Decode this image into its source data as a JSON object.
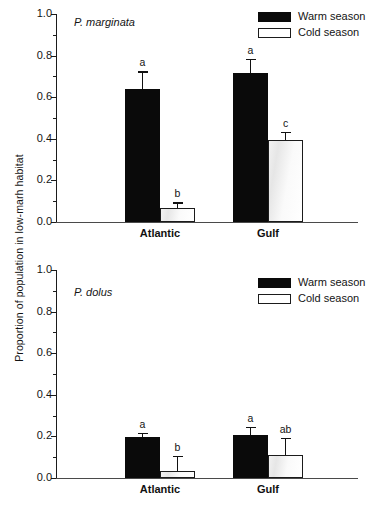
{
  "figure": {
    "ylabel": "Proportion of population in low-marh habitat"
  },
  "legend": {
    "warm_label": "Warm season",
    "cold_label": "Cold season"
  },
  "panels": [
    {
      "species": "P. marginata",
      "xticks": [
        "Atlantic",
        "Gulf"
      ],
      "yticks": [
        "1.0",
        "0.8",
        "0.6",
        "0.4",
        "0.2",
        "0.0"
      ]
    },
    {
      "species": "P. dolus",
      "xticks": [
        "Atlantic",
        "Gulf"
      ],
      "yticks": [
        "1.0",
        "0.8",
        "0.6",
        "0.4",
        "0.2",
        "0.0"
      ]
    }
  ],
  "chart_data": [
    {
      "type": "bar",
      "title": "P. marginata",
      "xlabel": "",
      "ylabel": "Proportion of population in low-marh habitat",
      "ylim": [
        0.0,
        1.0
      ],
      "ytick_values": [
        0.0,
        0.2,
        0.4,
        0.6,
        0.8,
        1.0
      ],
      "yminor_step": 0.1,
      "grid": false,
      "legend_position": "top-right",
      "categories": [
        "Atlantic",
        "Gulf"
      ],
      "series": [
        {
          "name": "Warm season",
          "color": "#0a0a0a",
          "values": [
            0.64,
            0.715
          ],
          "errors": [
            0.085,
            0.07
          ],
          "sig_letters": [
            "a",
            "a"
          ]
        },
        {
          "name": "Cold season",
          "color": "#ffffff",
          "values": [
            0.065,
            0.395
          ],
          "errors": [
            0.03,
            0.04
          ],
          "sig_letters": [
            "b",
            "c"
          ]
        }
      ]
    },
    {
      "type": "bar",
      "title": "P. dolus",
      "xlabel": "",
      "ylabel": "Proportion of population in low-marh habitat",
      "ylim": [
        0.0,
        1.0
      ],
      "ytick_values": [
        0.0,
        0.2,
        0.4,
        0.6,
        0.8,
        1.0
      ],
      "yminor_step": 0.1,
      "grid": false,
      "legend_position": "top-right",
      "categories": [
        "Atlantic",
        "Gulf"
      ],
      "series": [
        {
          "name": "Warm season",
          "color": "#0a0a0a",
          "values": [
            0.197,
            0.205
          ],
          "errors": [
            0.021,
            0.04
          ],
          "sig_letters": [
            "a",
            "a"
          ]
        },
        {
          "name": "Cold season",
          "color": "#ffffff",
          "values": [
            0.035,
            0.112
          ],
          "errors": [
            0.072,
            0.082
          ],
          "sig_letters": [
            "b",
            "ab"
          ]
        }
      ]
    }
  ]
}
